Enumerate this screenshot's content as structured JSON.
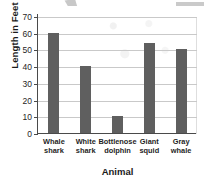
{
  "chart_data": {
    "type": "bar",
    "title": "",
    "xlabel": "Animal",
    "ylabel": "Length in Feet",
    "categories": [
      "Whale shark",
      "White shark",
      "Bottlenose dolphin",
      "Giant squid",
      "Gray whale"
    ],
    "category_lines": [
      [
        "Whale",
        "shark"
      ],
      [
        "White",
        "shark"
      ],
      [
        "Bottlenose",
        "dolphin"
      ],
      [
        "Giant",
        "squid"
      ],
      [
        "Gray",
        "whale"
      ]
    ],
    "values": [
      60,
      40,
      10,
      54,
      50
    ],
    "ylim": [
      0,
      70
    ],
    "ytick_labels": [
      "0",
      "10",
      "20",
      "30",
      "40",
      "50",
      "60",
      "70"
    ],
    "ytick_values": [
      0,
      10,
      20,
      30,
      40,
      50,
      60,
      70
    ],
    "grid": true,
    "legend": false,
    "bar_color": "#5f5f5f",
    "grid_color": "#c9c9c9",
    "axis_color": "#4a4a4a"
  }
}
